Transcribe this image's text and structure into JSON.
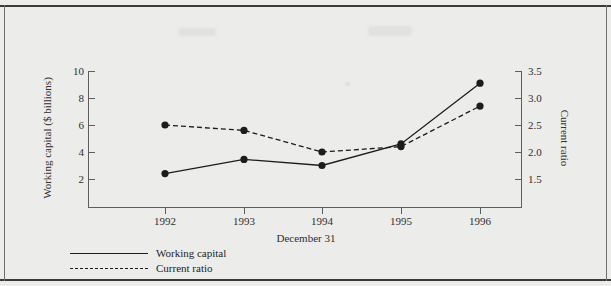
{
  "figure": {
    "background_color": "#ececeb",
    "line_color": "#1c1c1c",
    "axis_color": "#5e5e5e"
  },
  "chart_data": {
    "type": "line",
    "title": "",
    "xlabel": "December 31",
    "categories": [
      "1992",
      "1993",
      "1994",
      "1995",
      "1996"
    ],
    "grid": false,
    "legend_position": "bottom-left",
    "axes": {
      "left": {
        "label": "Working capital ($ billions)",
        "ticks": [
          "2",
          "4",
          "6",
          "8",
          "10"
        ],
        "tick_values": [
          2,
          4,
          6,
          8,
          10
        ],
        "lim": [
          1.0,
          10.0
        ]
      },
      "right": {
        "label": "Current ratio",
        "ticks": [
          "1.5",
          "2.0",
          "2.5",
          "3.0",
          "3.5"
        ],
        "tick_values": [
          1.5,
          2.0,
          2.5,
          3.0,
          3.5
        ],
        "lim": [
          1.25,
          3.5
        ]
      },
      "bottom": {
        "label": "December 31",
        "ticks": [
          "1992",
          "1993",
          "1994",
          "1995",
          "1996"
        ]
      }
    },
    "series": [
      {
        "name": "Working capital",
        "axis": "left",
        "style": "solid",
        "marker": "filled-circle",
        "values": [
          2.4,
          3.45,
          3.0,
          4.6,
          9.1
        ]
      },
      {
        "name": "Current ratio",
        "axis": "right",
        "style": "dashed",
        "marker": "filled-circle",
        "values": [
          2.5,
          2.4,
          2.0,
          2.1,
          2.85
        ]
      }
    ]
  },
  "legend": {
    "items": [
      {
        "label": "Working capital",
        "style": "solid"
      },
      {
        "label": "Current ratio",
        "style": "dashed"
      }
    ]
  }
}
